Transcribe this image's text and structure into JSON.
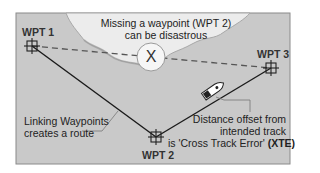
{
  "diagram": {
    "title_note": {
      "line1": "Missing a waypoint (WPT 2)",
      "line2": "can be disastrous"
    },
    "waypoints": [
      {
        "id": "wpt1",
        "label": "WPT 1"
      },
      {
        "id": "wpt2",
        "label": "WPT 2"
      },
      {
        "id": "wpt3",
        "label": "WPT 3"
      }
    ],
    "route_note": {
      "line1": "Linking Waypoints",
      "line2": "creates a route"
    },
    "xte_note": {
      "line1": "Distance offset from",
      "line2": "intended track",
      "line3_prefix": "is 'Cross Track Error' ",
      "line3_bold": "(XTE)"
    },
    "missed_marker": "X",
    "colors": {
      "water": "#c9c9c9",
      "land": "#ececec",
      "frame": "#8a8a8a",
      "route_line": "#1a1a1a",
      "dashed_line": "#555555"
    }
  }
}
